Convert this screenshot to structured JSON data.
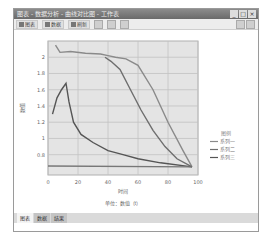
{
  "window": {
    "title": "图表 - 数据分析 - 曲线对比图 - 工作表",
    "controls": [
      "_",
      "□",
      "×"
    ]
  },
  "toolbar": {
    "items": [
      {
        "icon": "chart-icon",
        "label": "图表"
      },
      {
        "icon": "data-icon",
        "label": "数据"
      },
      {
        "icon": "refresh-icon",
        "label": "刷新"
      }
    ],
    "icon_buttons": [
      "bar-chart-icon",
      "line-chart-icon",
      "save-icon"
    ],
    "right_buttons": [
      "help-icon",
      "close-icon"
    ]
  },
  "sheet_tabs": [
    {
      "label": "图表",
      "active": true
    },
    {
      "label": "数据",
      "active": false
    },
    {
      "label": "结果",
      "active": false
    }
  ],
  "chart_data": {
    "type": "line",
    "title": "",
    "xlabel": "时间",
    "ylabel": "数值",
    "caption": "单位：数值（t）",
    "x_ticks": [
      0,
      20,
      40,
      60,
      80,
      100
    ],
    "y_ticks": [
      0.8,
      1.0,
      1.2,
      1.4,
      1.6,
      1.8,
      2.0
    ],
    "xlim": [
      0,
      100
    ],
    "ylim": [
      0.55,
      2.2
    ],
    "grid": true,
    "legend_position": "right",
    "legend_title": "图例",
    "series": [
      {
        "name": "系列一",
        "color": "#8a8a8a",
        "x": [
          5,
          8,
          15,
          25,
          35,
          40,
          45,
          52,
          60,
          70,
          80,
          90,
          96
        ],
        "y": [
          2.15,
          2.06,
          2.07,
          2.05,
          2.04,
          2.02,
          2.0,
          1.98,
          1.9,
          1.6,
          1.2,
          0.85,
          0.65
        ]
      },
      {
        "name": "系列二",
        "color": "#6e6e6e",
        "x": [
          38,
          42,
          48,
          55,
          62,
          70,
          78,
          86,
          96
        ],
        "y": [
          2.0,
          1.95,
          1.85,
          1.6,
          1.35,
          1.1,
          0.9,
          0.75,
          0.65
        ]
      },
      {
        "name": "系列三",
        "color": "#555555",
        "x": [
          3,
          6,
          9,
          12,
          14,
          17,
          22,
          30,
          40,
          50,
          60,
          75,
          96
        ],
        "y": [
          1.3,
          1.5,
          1.6,
          1.68,
          1.45,
          1.2,
          1.05,
          0.95,
          0.85,
          0.8,
          0.75,
          0.7,
          0.65
        ]
      },
      {
        "name": "基线",
        "color": "#777777",
        "x": [
          0,
          96
        ],
        "y": [
          0.66,
          0.65
        ]
      }
    ]
  }
}
